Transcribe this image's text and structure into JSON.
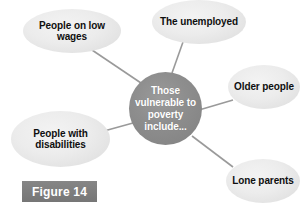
{
  "figure": {
    "caption": "Figure 14",
    "caption_bg": "#7d7d7d",
    "caption_color": "#ffffff",
    "background": "#ffffff"
  },
  "diagram": {
    "type": "mind-map",
    "center": {
      "id": "center",
      "text": "Those vulnerable to poverty include...",
      "lines": [
        "Those",
        "vulnerable",
        "to poverty",
        "include..."
      ],
      "fill": "#8c8c8c",
      "text_color": "#ffffff",
      "shape": "circle"
    },
    "connector_color": "#9a9a9a",
    "nodes": [
      {
        "id": "low-wages",
        "text": "People on low wages",
        "lines": [
          "People on",
          "low wages"
        ],
        "fill": "#ececec",
        "text_color": "#0f0f0f",
        "shape": "ellipse"
      },
      {
        "id": "unemployed",
        "text": "The unemployed",
        "lines": [
          "The",
          "unemployed"
        ],
        "fill": "#ececec",
        "text_color": "#0f0f0f",
        "shape": "ellipse"
      },
      {
        "id": "older-people",
        "text": "Older people",
        "lines": [
          "Older",
          "people"
        ],
        "fill": "#ececec",
        "text_color": "#0f0f0f",
        "shape": "ellipse"
      },
      {
        "id": "lone-parents",
        "text": "Lone parents",
        "lines": [
          "Lone",
          "parents"
        ],
        "fill": "#ececec",
        "text_color": "#0f0f0f",
        "shape": "ellipse"
      },
      {
        "id": "people-with-disabilities",
        "text": "People with disabilities",
        "lines": [
          "People",
          "with",
          "disabilities"
        ],
        "fill": "#ececec",
        "text_color": "#0f0f0f",
        "shape": "ellipse"
      }
    ]
  }
}
